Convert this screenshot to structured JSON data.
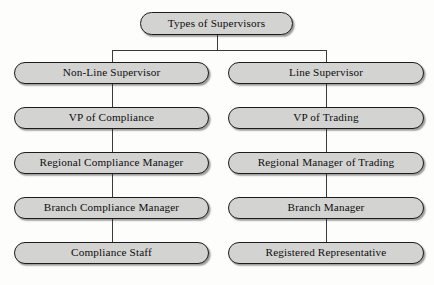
{
  "diagram": {
    "title": "Types of Supervisors",
    "root": {
      "label": "Types of Supervisors"
    },
    "columns": [
      {
        "id": "non-line",
        "nodes": [
          {
            "label": "Non-Line Supervisor"
          },
          {
            "label": "VP of Compliance"
          },
          {
            "label": "Regional Compliance Manager"
          },
          {
            "label": "Branch Compliance Manager"
          },
          {
            "label": "Compliance Staff"
          }
        ]
      },
      {
        "id": "line",
        "nodes": [
          {
            "label": "Line Supervisor"
          },
          {
            "label": "VP of Trading"
          },
          {
            "label": "Regional Manager of Trading"
          },
          {
            "label": "Branch Manager"
          },
          {
            "label": "Registered Representative"
          }
        ]
      }
    ],
    "colors": {
      "node_fill": "#d3d3d2",
      "node_border": "#1c1c1c",
      "connector": "#3a3a3a",
      "background": "#fdfdfc",
      "text": "#0d0d0d"
    }
  }
}
